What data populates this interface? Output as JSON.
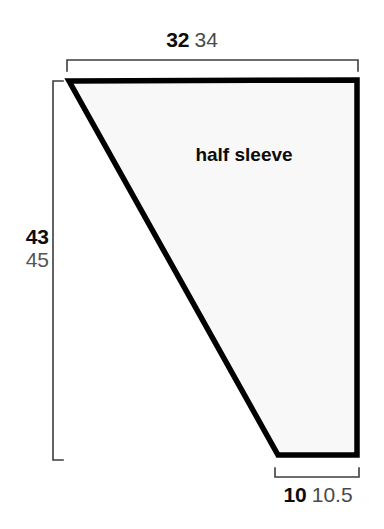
{
  "canvas": {
    "width": 384,
    "height": 529,
    "background_color": "#ffffff"
  },
  "figure": {
    "kind": "sewing-pattern-piece",
    "piece_label": "half sleeve",
    "fill_color": "#f8f8f8",
    "outline_color": "#000000",
    "outline_width_px": 5,
    "vertices": [
      {
        "x": 69,
        "y": 81
      },
      {
        "x": 357,
        "y": 80
      },
      {
        "x": 357,
        "y": 455
      },
      {
        "x": 278,
        "y": 455
      }
    ]
  },
  "dimensions": {
    "top": {
      "primary": "32",
      "secondary": "34",
      "bracket": {
        "x1": 67,
        "x2": 358,
        "y": 60,
        "tick": 11,
        "direction": "down"
      }
    },
    "left": {
      "primary": "43",
      "secondary": "45",
      "bracket": {
        "y1": 81,
        "y2": 460,
        "x": 53,
        "tick": 10,
        "direction": "right"
      }
    },
    "bottom": {
      "primary": "10",
      "secondary": "10.5",
      "bracket": {
        "x1": 275,
        "x2": 359,
        "y": 477,
        "tick": 9,
        "direction": "up"
      }
    },
    "bracket_color": "#3d3d3d",
    "bracket_width_px": 1.6
  }
}
